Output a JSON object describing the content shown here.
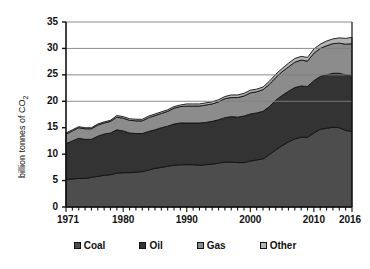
{
  "chart_data": {
    "type": "area",
    "stacked": true,
    "title": "",
    "xlabel": "",
    "ylabel": "billion tonnes of CO2",
    "ylabel_display": "billion tonnes of CO",
    "ylabel_subscript": "2",
    "ylim": [
      0,
      35
    ],
    "xlim": [
      1971,
      2016
    ],
    "yticks": [
      0,
      5,
      10,
      15,
      20,
      25,
      30,
      35
    ],
    "xticks": [
      1971,
      1980,
      1990,
      2000,
      2010,
      2016
    ],
    "xtick_labels": [
      "1971",
      "1980",
      "1990",
      "2000",
      "2010",
      "2016"
    ],
    "ytick_labels": [
      "0",
      "5",
      "10",
      "15",
      "20",
      "25",
      "30",
      "35"
    ],
    "grid": "horizontal",
    "gridlines": [
      20,
      25,
      30,
      35
    ],
    "legend_position": "bottom",
    "x": [
      1971,
      1972,
      1973,
      1974,
      1975,
      1976,
      1977,
      1978,
      1979,
      1980,
      1981,
      1982,
      1983,
      1984,
      1985,
      1986,
      1987,
      1988,
      1989,
      1990,
      1991,
      1992,
      1993,
      1994,
      1995,
      1996,
      1997,
      1998,
      1999,
      2000,
      2001,
      2002,
      2003,
      2004,
      2005,
      2006,
      2007,
      2008,
      2009,
      2010,
      2011,
      2012,
      2013,
      2014,
      2015,
      2016
    ],
    "series": [
      {
        "name": "Coal",
        "color": "#4d4d4d",
        "values": [
          5.2,
          5.3,
          5.4,
          5.4,
          5.6,
          5.8,
          6.0,
          6.1,
          6.4,
          6.5,
          6.5,
          6.6,
          6.7,
          7.0,
          7.3,
          7.5,
          7.7,
          7.9,
          8.0,
          8.0,
          8.0,
          7.9,
          8.0,
          8.1,
          8.3,
          8.5,
          8.5,
          8.4,
          8.4,
          8.7,
          8.9,
          9.1,
          9.9,
          10.8,
          11.6,
          12.3,
          12.9,
          13.2,
          13.2,
          14.0,
          14.7,
          14.9,
          15.1,
          15.0,
          14.5,
          14.3
        ]
      },
      {
        "name": "Oil",
        "color": "#333333",
        "values": [
          6.8,
          7.2,
          7.6,
          7.4,
          7.2,
          7.6,
          7.8,
          7.9,
          8.2,
          7.9,
          7.5,
          7.3,
          7.2,
          7.3,
          7.3,
          7.5,
          7.6,
          7.8,
          7.9,
          7.9,
          7.9,
          8.0,
          8.0,
          8.1,
          8.2,
          8.4,
          8.6,
          8.6,
          8.8,
          8.9,
          8.9,
          9.0,
          9.1,
          9.4,
          9.5,
          9.6,
          9.7,
          9.7,
          9.6,
          9.9,
          10.0,
          10.1,
          10.2,
          10.3,
          10.5,
          10.6
        ]
      },
      {
        "name": "Gas",
        "color": "#8c8c8c",
        "values": [
          1.8,
          1.9,
          2.0,
          2.0,
          2.0,
          2.1,
          2.1,
          2.2,
          2.4,
          2.4,
          2.4,
          2.4,
          2.4,
          2.6,
          2.7,
          2.7,
          2.8,
          3.0,
          3.1,
          3.2,
          3.2,
          3.2,
          3.3,
          3.3,
          3.4,
          3.6,
          3.6,
          3.7,
          3.8,
          4.0,
          4.0,
          4.1,
          4.2,
          4.3,
          4.5,
          4.6,
          4.8,
          4.9,
          4.8,
          5.2,
          5.3,
          5.5,
          5.6,
          5.7,
          5.8,
          6.0
        ]
      },
      {
        "name": "Other",
        "color": "#b3b3b3",
        "values": [
          0.2,
          0.2,
          0.2,
          0.2,
          0.2,
          0.2,
          0.2,
          0.2,
          0.3,
          0.3,
          0.3,
          0.3,
          0.3,
          0.3,
          0.3,
          0.3,
          0.3,
          0.3,
          0.3,
          0.4,
          0.4,
          0.4,
          0.4,
          0.4,
          0.4,
          0.4,
          0.5,
          0.5,
          0.5,
          0.5,
          0.5,
          0.5,
          0.6,
          0.6,
          0.6,
          0.7,
          0.7,
          0.7,
          0.7,
          0.8,
          0.8,
          0.9,
          0.9,
          1.0,
          1.1,
          1.2
        ]
      }
    ],
    "legend": [
      "Coal",
      "Oil",
      "Gas",
      "Other"
    ]
  },
  "plot": {
    "left": 66,
    "top": 22,
    "right": 352,
    "bottom": 207,
    "axis_color": "#111111",
    "grid_color": "#808080",
    "background": "#ffffff"
  }
}
